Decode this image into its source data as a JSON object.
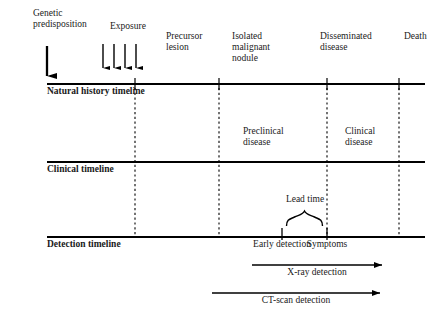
{
  "figure": {
    "type": "timeline-diagram",
    "background": "#ffffff",
    "ink": "#000000"
  },
  "timelines": [
    {
      "name": "natural-history",
      "label": "Natural history timeline",
      "y": 84,
      "x1": 47,
      "x2": 425
    },
    {
      "name": "clinical",
      "label": "Clinical timeline",
      "y": 162,
      "x1": 47,
      "x2": 425
    },
    {
      "name": "detection",
      "label": "Detection timeline",
      "y": 237,
      "x1": 47,
      "x2": 425
    }
  ],
  "stage_labels": [
    {
      "name": "genetic-predisposition",
      "text": "Genetic\npredisposition",
      "x": 33,
      "y": 10
    },
    {
      "name": "exposure",
      "text": "Exposure",
      "x": 110,
      "y": 23
    },
    {
      "name": "precursor-lesion",
      "text": "Precursor\nlesion",
      "x": 166,
      "y": 33
    },
    {
      "name": "isolated-malignant-nodule",
      "text": "Isolated\nmalignant\nnodule",
      "x": 232,
      "y": 33
    },
    {
      "name": "disseminated-disease",
      "text": "Disseminated\ndisease",
      "x": 320,
      "y": 33
    },
    {
      "name": "death",
      "text": "Death",
      "x": 404,
      "y": 33
    }
  ],
  "clinical_phase_labels": [
    {
      "name": "preclinical-disease",
      "text": "Preclinical\ndisease",
      "x": 243,
      "y": 128
    },
    {
      "name": "clinical-disease",
      "text": "Clinical\ndisease",
      "x": 345,
      "y": 128
    }
  ],
  "detection_points": [
    {
      "name": "early-detection",
      "text": "Early detection",
      "x": 282
    },
    {
      "name": "symptoms",
      "text": "Symptoms",
      "x": 327
    }
  ],
  "lead_time": {
    "label": "Lead time",
    "x_start": 282,
    "x_end": 327,
    "label_x": 305,
    "label_y": 196
  },
  "dashed_guides": [
    {
      "name": "guide-precursor",
      "x": 135,
      "y1": 84,
      "y2": 237
    },
    {
      "name": "guide-isolated-nodule",
      "x": 219,
      "y1": 84,
      "y2": 237
    },
    {
      "name": "guide-disseminated",
      "x": 327,
      "y1": 84,
      "y2": 237
    },
    {
      "name": "guide-death",
      "x": 399,
      "y1": 84,
      "y2": 237
    }
  ],
  "natural_history_ticks": [
    135,
    219,
    327,
    399
  ],
  "exposure_arrows": [
    103,
    114,
    125,
    136
  ],
  "genetic_arrow_x": 47,
  "detection_arrows": [
    {
      "name": "xray-detection",
      "label": "X-ray detection",
      "x_start": 252,
      "x_end": 382,
      "y": 265,
      "label_x": 317,
      "label_y": 268
    },
    {
      "name": "ct-scan-detection",
      "label": "CT-scan detection",
      "x_start": 212,
      "x_end": 380,
      "y": 293,
      "label_x": 296,
      "label_y": 296
    }
  ]
}
